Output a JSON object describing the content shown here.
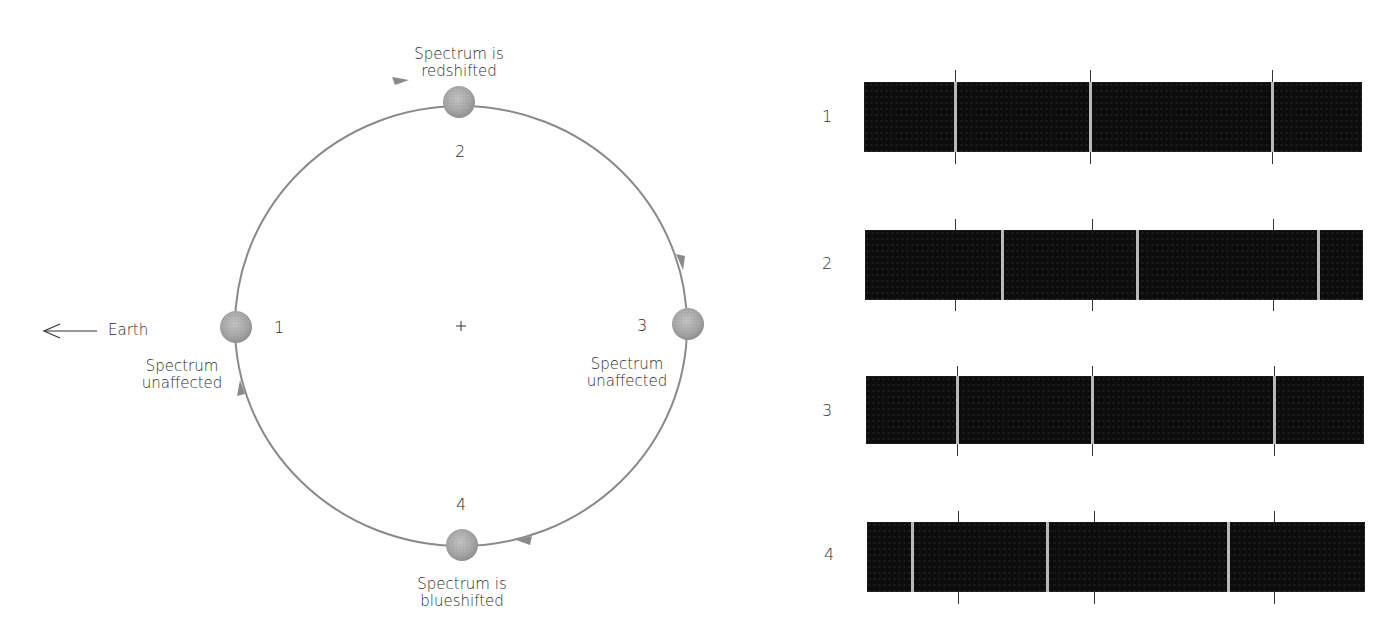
{
  "figure": {
    "cropped_caption": "",
    "center_marker": "+",
    "earth": {
      "label": "Earth",
      "arrow_icon": "left-arrow"
    },
    "orbit": {
      "direction": "clockwise",
      "center": [
        461,
        326
      ],
      "rx": 226,
      "ry": 220,
      "line_color": "#8a8a8a"
    },
    "stars": [
      {
        "id": "1",
        "number": "1",
        "caption_line1": "Spectrum",
        "caption_line2": "unaffected",
        "position": "left (nearest-side, facing Earth)"
      },
      {
        "id": "2",
        "number": "2",
        "caption_line1": "Spectrum is",
        "caption_line2": "redshifted",
        "position": "top"
      },
      {
        "id": "3",
        "number": "3",
        "caption_line1": "Spectrum",
        "caption_line2": "unaffected",
        "position": "right"
      },
      {
        "id": "4",
        "number": "4",
        "caption_line1": "Spectrum is",
        "caption_line2": "blueshifted",
        "position": "bottom"
      }
    ],
    "spectra": [
      {
        "label": "1",
        "shift": "none",
        "reference_ticks_x": [
          955,
          1090,
          1272
        ],
        "line_x": [
          955,
          1090,
          1272
        ]
      },
      {
        "label": "2",
        "shift": "red (right)",
        "reference_ticks_x": [
          955,
          1092,
          1273
        ],
        "line_x": [
          1002,
          1137,
          1318
        ]
      },
      {
        "label": "3",
        "shift": "none",
        "reference_ticks_x": [
          957,
          1092,
          1274
        ],
        "line_x": [
          957,
          1092,
          1274
        ]
      },
      {
        "label": "4",
        "shift": "blue (left)",
        "reference_ticks_x": [
          958,
          1094,
          1274
        ],
        "line_x": [
          913,
          1048,
          1229
        ]
      }
    ],
    "colors": {
      "spectrum_background": "#0c0c0c",
      "spectral_line": "#b9b9b9",
      "star_fill": "#a9a9a9",
      "orbit_line": "#8a8a8a",
      "text": "#2b2b2b"
    }
  }
}
